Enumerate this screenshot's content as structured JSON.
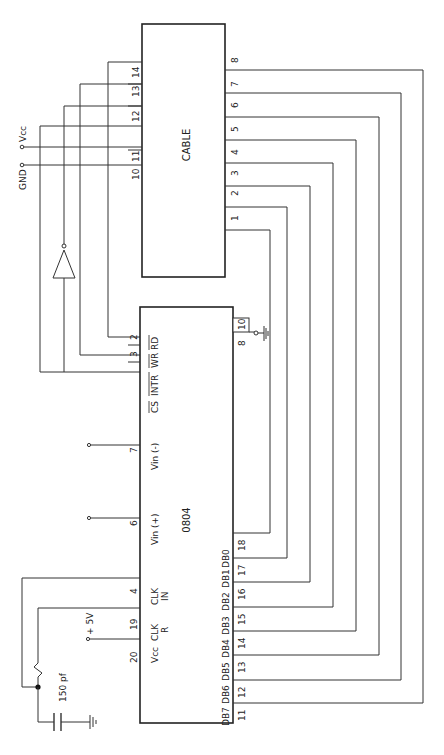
{
  "chip": {
    "name": "0804",
    "pins": {
      "vcc": {
        "num": "20",
        "label": "Vcc"
      },
      "clkr": {
        "num": "19",
        "label": "CLK",
        "label2": "R"
      },
      "clkin": {
        "num": "4",
        "label": "CLK",
        "label2": "IN"
      },
      "vinp": {
        "num": "6",
        "label": "Vin (+)"
      },
      "vinn": {
        "num": "7",
        "label": "Vin (-)"
      },
      "cs": {
        "label": "CS"
      },
      "intr": {
        "label": "INTR"
      },
      "wr": {
        "num": "3",
        "label": "WR"
      },
      "rd": {
        "num": "2",
        "label": "RD"
      },
      "gnd_a": {
        "num": "8"
      },
      "gnd_b": {
        "num": "10"
      },
      "db": [
        {
          "num": "11",
          "label": "DB7"
        },
        {
          "num": "12",
          "label": "DB6"
        },
        {
          "num": "13",
          "label": "DB5"
        },
        {
          "num": "14",
          "label": "DB4"
        },
        {
          "num": "15",
          "label": "DB3"
        },
        {
          "num": "16",
          "label": "DB2"
        },
        {
          "num": "17",
          "label": "DB1"
        },
        {
          "num": "18",
          "label": "DB0"
        }
      ]
    }
  },
  "cable": {
    "name": "CABLE",
    "top_pins": [
      "10",
      "11",
      "12",
      "13",
      "14"
    ],
    "side_pins": [
      "1",
      "2",
      "3",
      "4",
      "5",
      "6",
      "7",
      "8"
    ]
  },
  "power": {
    "plus5v": "+ 5V",
    "vcc": "Vcc",
    "gnd": "GND"
  },
  "capacitor": {
    "label": "150 pf"
  }
}
